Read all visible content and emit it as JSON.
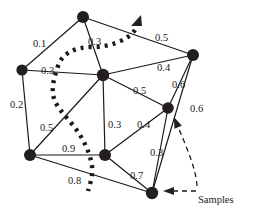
{
  "figure": {
    "kind": "undirected-weighted-graph-diagram",
    "background_color": "#ffffff",
    "ink_color": "#1a1a1a",
    "node_color": "#231f20",
    "width": 255,
    "height": 214
  },
  "nodes": [
    {
      "id": "n_top",
      "name": "node-top",
      "x": 83,
      "y": 17,
      "r": 6.0
    },
    {
      "id": "n_left",
      "name": "node-left",
      "x": 22,
      "y": 70,
      "r": 5.6
    },
    {
      "id": "n_center",
      "name": "node-center",
      "x": 103,
      "y": 75,
      "r": 6.2
    },
    {
      "id": "n_right",
      "name": "node-right",
      "x": 193,
      "y": 55,
      "r": 6.0
    },
    {
      "id": "n_midright",
      "name": "node-mid-right",
      "x": 168,
      "y": 108,
      "r": 5.8
    },
    {
      "id": "n_bottomleft",
      "name": "node-bottom-left",
      "x": 30,
      "y": 155,
      "r": 6.0
    },
    {
      "id": "n_bottomcenter",
      "name": "node-bottom-center",
      "x": 105,
      "y": 155,
      "r": 6.0
    },
    {
      "id": "n_bottom",
      "name": "node-bottom",
      "x": 152,
      "y": 193,
      "r": 6.2
    }
  ],
  "edges": [
    {
      "id": "e1",
      "name": "edge-top-left",
      "from": "n_top",
      "to": "n_left",
      "weight": "0.1",
      "lx": 33,
      "ly": 39
    },
    {
      "id": "e2",
      "name": "edge-top-center",
      "from": "n_top",
      "to": "n_center",
      "weight": "0.3",
      "lx": 88,
      "ly": 37
    },
    {
      "id": "e3",
      "name": "edge-top-right",
      "from": "n_top",
      "to": "n_right",
      "weight": "0.5",
      "lx": 155,
      "ly": 33
    },
    {
      "id": "e4",
      "name": "edge-left-center",
      "from": "n_left",
      "to": "n_center",
      "weight": "0.3",
      "lx": 41,
      "ly": 66
    },
    {
      "id": "e5",
      "name": "edge-center-right",
      "from": "n_center",
      "to": "n_right",
      "weight": "0.4",
      "lx": 157,
      "ly": 63
    },
    {
      "id": "e6",
      "name": "edge-right-midright",
      "from": "n_right",
      "to": "n_midright",
      "weight": "0.6",
      "lx": 172,
      "ly": 80
    },
    {
      "id": "e7",
      "name": "edge-left-bottomleft",
      "from": "n_left",
      "to": "n_bottomleft",
      "weight": "0.2",
      "lx": 10,
      "ly": 100
    },
    {
      "id": "e8",
      "name": "edge-bottomleft-center",
      "from": "n_bottomleft",
      "to": "n_center",
      "weight": "0.5",
      "lx": 40,
      "ly": 123
    },
    {
      "id": "e9",
      "name": "edge-right-bottom",
      "from": "n_right",
      "to": "n_bottom",
      "weight": "0.6",
      "lx": 190,
      "ly": 104
    },
    {
      "id": "e10",
      "name": "edge-center-midright",
      "from": "n_center",
      "to": "n_midright",
      "weight": "0.5",
      "lx": 133,
      "ly": 86
    },
    {
      "id": "e11",
      "name": "edge-center-bottomcenter",
      "from": "n_center",
      "to": "n_bottomcenter",
      "weight": "0.3",
      "lx": 108,
      "ly": 120
    },
    {
      "id": "e12",
      "name": "edge-bottomcenter-midright",
      "from": "n_bottomcenter",
      "to": "n_midright",
      "weight": "0.4",
      "lx": 137,
      "ly": 120
    },
    {
      "id": "e13",
      "name": "edge-bottomleft-bottomcenter",
      "from": "n_bottomleft",
      "to": "n_bottomcenter",
      "weight": "0.9",
      "lx": 62,
      "ly": 144
    },
    {
      "id": "e14",
      "name": "edge-midright-bottom",
      "from": "n_midright",
      "to": "n_bottom",
      "weight": "0.3",
      "lx": 150,
      "ly": 148
    },
    {
      "id": "e15",
      "name": "edge-bottomcenter-bottom",
      "from": "n_bottomcenter",
      "to": "n_bottom",
      "weight": "0.7",
      "lx": 130,
      "ly": 171
    },
    {
      "id": "e16",
      "name": "edge-bottomleft-bottom",
      "from": "n_bottomleft",
      "to": "n_bottom",
      "weight": "0.8",
      "lx": 68,
      "ly": 176
    }
  ],
  "dotted_curve": {
    "name": "dotted-sample-boundary-curve",
    "path": "M 135 30 C 128 40, 110 47, 92 47 C 74 47, 62 54, 58 66 C 54 78, 52 86, 53 94 C 54 104, 62 112, 72 124 C 82 136, 90 152, 92 166 C 93 176, 90 184, 88 191",
    "dash": "3 5",
    "width": 4.4
  },
  "annotations": {
    "samples_label": "Samples",
    "samples_label_x": 198,
    "samples_label_y": 195,
    "curve_arrowhead": {
      "name": "curve-direction-arrowhead",
      "x": 137,
      "y": 22
    },
    "leader_to_node": {
      "name": "samples-leader-to-bottom-node"
    },
    "leader_to_edge": {
      "name": "samples-leader-to-midright-edge"
    }
  }
}
